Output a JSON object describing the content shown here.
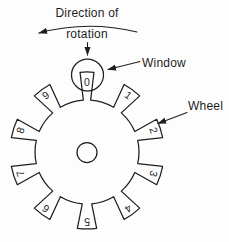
{
  "diagram": {
    "colors": {
      "ink": "#1e1e1e",
      "background": "#fdfdfd"
    },
    "labels": {
      "direction_line1": "Direction of",
      "direction_line2": "rotation",
      "window": "Window",
      "wheel": "Wheel"
    },
    "wheel": {
      "digits": [
        "0",
        "1",
        "2",
        "3",
        "4",
        "5",
        "6",
        "7",
        "8",
        "9"
      ],
      "teeth": 10,
      "center": {
        "x": 87,
        "y": 152
      },
      "root_radius": 52,
      "tip_radius": 77,
      "top_tooth_tip_radius": 80,
      "digit_radius": 70,
      "hub_radius": 10,
      "tooth_half_tip_deg": 7.2,
      "tooth_half_root_deg": 5.2,
      "top_tooth_half_tip_deg": 5,
      "top_tooth_half_root_deg": 4
    },
    "window_circle": {
      "cx": 87.5,
      "cy": 75,
      "r": 16
    }
  }
}
